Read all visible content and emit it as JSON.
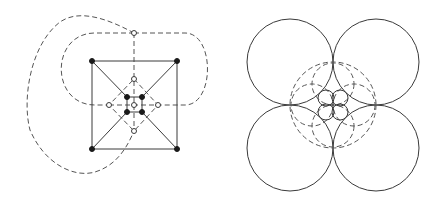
{
  "figure": {
    "panels": [
      {
        "id": "left",
        "description": "Planar graph: square with diagonals containing nested diamond and inner square, with its dual drawn dashed",
        "colors": {
          "stroke": "#3a3a3a",
          "dashed": "#555555",
          "filled_node": "#1a1a1a",
          "open_node": "#ffffff"
        },
        "outer_square": [
          [
            92,
            61
          ],
          [
            177,
            61
          ],
          [
            177,
            149
          ],
          [
            92,
            149
          ]
        ],
        "inner_square": [
          [
            127,
            97
          ],
          [
            142,
            97
          ],
          [
            142,
            112
          ],
          [
            127,
            112
          ]
        ],
        "diamond": [
          [
            134,
            79
          ],
          [
            158,
            105
          ],
          [
            134,
            131
          ],
          [
            109,
            105
          ]
        ],
        "filled_nodes": [
          [
            92,
            61
          ],
          [
            177,
            61
          ],
          [
            92,
            149
          ],
          [
            177,
            149
          ],
          [
            127,
            97
          ],
          [
            142,
            97
          ],
          [
            127,
            112
          ],
          [
            142,
            112
          ]
        ],
        "open_nodes": [
          [
            134,
            33
          ],
          [
            134,
            79
          ],
          [
            109,
            105
          ],
          [
            158,
            105
          ],
          [
            134,
            131
          ],
          [
            134,
            105
          ]
        ]
      },
      {
        "id": "right",
        "description": "Circle packing representation: four large solid circles, dashed middle circles, small inner solid circles",
        "colors": {
          "stroke": "#3a3a3a",
          "dashed": "#555555"
        },
        "large_circles": [
          {
            "cx": 290,
            "cy": 62,
            "r": 43
          },
          {
            "cx": 376,
            "cy": 62,
            "r": 43
          },
          {
            "cx": 290,
            "cy": 148,
            "r": 43
          },
          {
            "cx": 376,
            "cy": 148,
            "r": 43
          }
        ],
        "dashed_outer_circle": {
          "cx": 333,
          "cy": 105,
          "r": 43
        },
        "dashed_mid_circles": [
          {
            "cx": 333,
            "cy": 84,
            "r": 21
          },
          {
            "cx": 333,
            "cy": 126,
            "r": 21
          },
          {
            "cx": 312,
            "cy": 105,
            "r": 21
          },
          {
            "cx": 354,
            "cy": 105,
            "r": 21
          }
        ],
        "small_circles": [
          {
            "cx": 326,
            "cy": 98,
            "r": 8
          },
          {
            "cx": 340,
            "cy": 98,
            "r": 8
          },
          {
            "cx": 326,
            "cy": 112,
            "r": 8
          },
          {
            "cx": 340,
            "cy": 112,
            "r": 8
          }
        ]
      }
    ]
  }
}
